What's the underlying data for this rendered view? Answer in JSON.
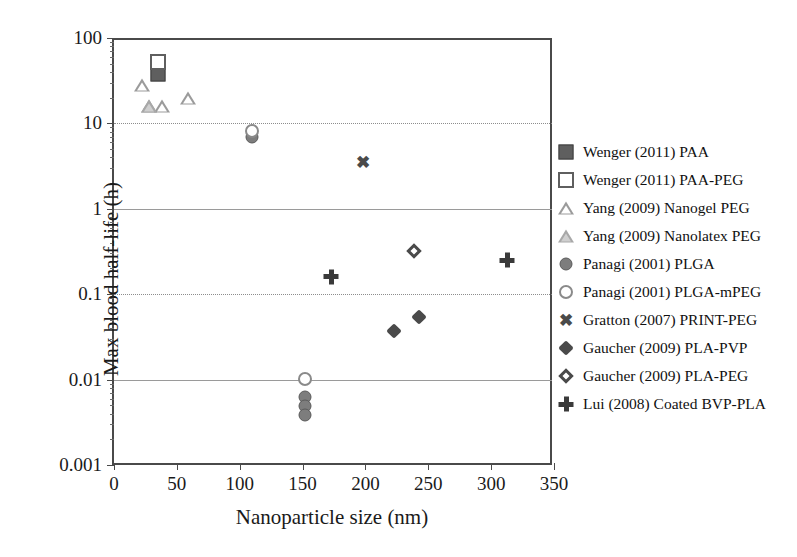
{
  "chart_data": {
    "type": "scatter",
    "title": "",
    "xlabel": "Nanoparticle size (nm)",
    "ylabel": "Max blood half-life (h)",
    "xlim": [
      0,
      350
    ],
    "ylim": [
      0.001,
      100
    ],
    "yscale": "log",
    "xscale": "linear",
    "xticks": [
      "0",
      "50",
      "100",
      "150",
      "200",
      "250",
      "300",
      "350"
    ],
    "xtick_values": [
      0,
      50,
      100,
      150,
      200,
      250,
      300,
      350
    ],
    "yticks": [
      "0.001",
      "0.01",
      "0.1",
      "1",
      "10",
      "100"
    ],
    "ytick_values": [
      0.001,
      0.01,
      0.1,
      1,
      10,
      100
    ],
    "grid": "horizontal-major",
    "legend_position": "right",
    "series": [
      {
        "name": "Wenger (2011) PAA",
        "marker": "filled-square",
        "color": "#5f5f5f",
        "points": [
          {
            "x": 35,
            "y": 38
          }
        ]
      },
      {
        "name": "Wenger (2011) PAA-PEG",
        "marker": "open-square",
        "color": "#5f5f5f",
        "points": [
          {
            "x": 35,
            "y": 52
          }
        ]
      },
      {
        "name": "Yang (2009) Nanogel PEG",
        "marker": "open-triangle",
        "color": "#9b9b9b",
        "points": [
          {
            "x": 22,
            "y": 28
          },
          {
            "x": 28,
            "y": 16
          },
          {
            "x": 38,
            "y": 16
          },
          {
            "x": 59,
            "y": 20
          }
        ]
      },
      {
        "name": "Yang (2009) Nanolatex PEG",
        "marker": "shaded-triangle",
        "color": "#a8a8a8",
        "points": [
          {
            "x": 28,
            "y": 16
          }
        ]
      },
      {
        "name": "Panagi (2001) PLGA",
        "marker": "filled-circle",
        "color": "#7d7d7d",
        "points": [
          {
            "x": 110,
            "y": 7.0
          },
          {
            "x": 152,
            "y": 0.0062
          },
          {
            "x": 152,
            "y": 0.0049
          },
          {
            "x": 152,
            "y": 0.0039
          }
        ]
      },
      {
        "name": "Panagi (2001) PLGA-mPEG",
        "marker": "open-circle",
        "color": "#8a8a8a",
        "points": [
          {
            "x": 110,
            "y": 8.2
          },
          {
            "x": 152,
            "y": 0.0103
          }
        ]
      },
      {
        "name": "Gratton (2007) PRINT-PEG",
        "marker": "x",
        "color": "#4a4a4a",
        "points": [
          {
            "x": 198,
            "y": 3.5
          }
        ]
      },
      {
        "name": "Gaucher (2009) PLA-PVP",
        "marker": "filled-diamond",
        "color": "#4a4a4a",
        "points": [
          {
            "x": 223,
            "y": 0.037
          },
          {
            "x": 243,
            "y": 0.054
          }
        ]
      },
      {
        "name": "Gaucher (2009) PLA-PEG",
        "marker": "open-diamond",
        "color": "#4a4a4a",
        "points": [
          {
            "x": 239,
            "y": 0.32
          }
        ]
      },
      {
        "name": "Lui (2008) Coated BVP-PLA",
        "marker": "plus",
        "color": "#3a3a3a",
        "points": [
          {
            "x": 173,
            "y": 0.16
          },
          {
            "x": 313,
            "y": 0.25
          }
        ]
      }
    ]
  }
}
